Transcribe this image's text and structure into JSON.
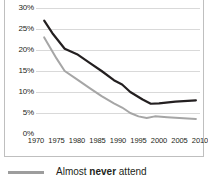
{
  "chart_data": {
    "type": "line",
    "title": "",
    "xlabel": "",
    "ylabel": "",
    "xlim": [
      1970,
      2010
    ],
    "ylim": [
      0,
      30
    ],
    "grid": true,
    "legend_position": "bottom-left",
    "x_ticks": [
      "1970",
      "1975",
      "1980",
      "1985",
      "1990",
      "1995",
      "2000",
      "2005",
      "2010"
    ],
    "y_ticks": [
      "0%",
      "5%",
      "10%",
      "15%",
      "20%",
      "25%",
      "30%"
    ],
    "series": [
      {
        "name": "dark-series",
        "color": "#231f20",
        "x": [
          1972,
          1974,
          1977,
          1980,
          1983,
          1986,
          1989,
          1991,
          1993,
          1996,
          1998,
          2000,
          2004,
          2009
        ],
        "values": [
          27.0,
          24.0,
          20.3,
          19.0,
          17.0,
          15.0,
          12.8,
          11.8,
          10.0,
          8.2,
          7.2,
          7.3,
          7.7,
          8.0
        ]
      },
      {
        "name": "gray-series",
        "color": "#a6a6a6",
        "x": [
          1972,
          1975,
          1977,
          1980,
          1983,
          1986,
          1989,
          1991,
          1993,
          1995,
          1997,
          1999,
          2002,
          2005,
          2009
        ],
        "values": [
          23.0,
          18.0,
          15.0,
          13.0,
          11.0,
          9.0,
          7.3,
          6.3,
          5.0,
          4.2,
          3.8,
          4.2,
          4.0,
          3.8,
          3.6
        ]
      }
    ]
  },
  "legend": {
    "swatch_color": "#9d9d9d",
    "prefix": "Almost ",
    "emphasis": "never",
    "suffix": " attend"
  }
}
